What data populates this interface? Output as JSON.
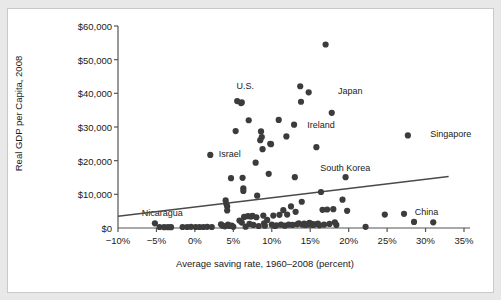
{
  "chart_data": {
    "type": "scatter",
    "title": "",
    "xlabel": "Average saving rate, 1960–2008 (percent)",
    "ylabel": "Real GDP per Capita, 2008",
    "xlim": [
      -10,
      35
    ],
    "ylim": [
      0,
      60000
    ],
    "xticks": [
      -10,
      -5,
      0,
      5,
      10,
      15,
      20,
      25,
      30,
      35
    ],
    "xtick_labels": [
      "−10%",
      "−5%",
      "0%",
      "5%",
      "10%",
      "15%",
      "20%",
      "25%",
      "30%",
      "35%"
    ],
    "yticks": [
      0,
      10000,
      20000,
      30000,
      40000,
      50000,
      60000
    ],
    "ytick_labels": [
      "$0",
      "$10,000",
      "$20,000",
      "$30,000",
      "$40,000",
      "$50,000",
      "$60,000"
    ],
    "grid": false,
    "legend": "none",
    "marker_color": "#3c3c3c",
    "line_color": "#4a4a4a",
    "axis_color": "#555555",
    "trendline": {
      "x": [
        -10.0,
        33.0
      ],
      "y": [
        3500,
        15300
      ]
    },
    "annotations": [
      {
        "text": "U.S.",
        "x": 5.4,
        "y": 41800
      },
      {
        "text": "Japan",
        "x": 18.6,
        "y": 40300
      },
      {
        "text": "Ireland",
        "x": 14.6,
        "y": 30300
      },
      {
        "text": "Singapore",
        "x": 30.6,
        "y": 27500
      },
      {
        "text": "Israel",
        "x": 3.1,
        "y": 21700
      },
      {
        "text": "South Korea",
        "x": 16.3,
        "y": 17500
      },
      {
        "text": "Nicaragua",
        "x": -6.9,
        "y": 4200
      },
      {
        "text": "China",
        "x": 28.6,
        "y": 4600
      }
    ],
    "points": [
      {
        "x": -5.2,
        "y": 1400
      },
      {
        "x": -4.6,
        "y": 300
      },
      {
        "x": -4.0,
        "y": 250
      },
      {
        "x": -3.5,
        "y": 250
      },
      {
        "x": -3.1,
        "y": 250
      },
      {
        "x": -1.6,
        "y": 300
      },
      {
        "x": -1.0,
        "y": 300
      },
      {
        "x": -0.5,
        "y": 350
      },
      {
        "x": 0.1,
        "y": 300
      },
      {
        "x": 0.6,
        "y": 300
      },
      {
        "x": 1.1,
        "y": 300
      },
      {
        "x": 1.6,
        "y": 350
      },
      {
        "x": 2.0,
        "y": 21700
      },
      {
        "x": 2.2,
        "y": 300
      },
      {
        "x": 3.4,
        "y": 1100
      },
      {
        "x": 3.6,
        "y": 700
      },
      {
        "x": 3.9,
        "y": 500
      },
      {
        "x": 4.0,
        "y": 8200
      },
      {
        "x": 4.1,
        "y": 7100
      },
      {
        "x": 4.2,
        "y": 6400
      },
      {
        "x": 4.2,
        "y": 5200
      },
      {
        "x": 4.3,
        "y": 1000
      },
      {
        "x": 4.5,
        "y": 600
      },
      {
        "x": 4.7,
        "y": 14800
      },
      {
        "x": 4.8,
        "y": 700
      },
      {
        "x": 5.0,
        "y": 350
      },
      {
        "x": 5.3,
        "y": 28800
      },
      {
        "x": 5.5,
        "y": 37700
      },
      {
        "x": 5.8,
        "y": 2200
      },
      {
        "x": 6.0,
        "y": 37100
      },
      {
        "x": 6.1,
        "y": 37300
      },
      {
        "x": 6.1,
        "y": 1600
      },
      {
        "x": 6.2,
        "y": 14900
      },
      {
        "x": 6.3,
        "y": 11800
      },
      {
        "x": 6.3,
        "y": 11000
      },
      {
        "x": 6.4,
        "y": 3300
      },
      {
        "x": 6.6,
        "y": 400
      },
      {
        "x": 6.9,
        "y": 3500
      },
      {
        "x": 7.0,
        "y": 32000
      },
      {
        "x": 7.1,
        "y": 1200
      },
      {
        "x": 7.3,
        "y": 3400
      },
      {
        "x": 7.5,
        "y": 3600
      },
      {
        "x": 7.6,
        "y": 900
      },
      {
        "x": 7.9,
        "y": 19400
      },
      {
        "x": 8.0,
        "y": 3200
      },
      {
        "x": 8.1,
        "y": 9600
      },
      {
        "x": 8.3,
        "y": 600
      },
      {
        "x": 8.5,
        "y": 26100
      },
      {
        "x": 8.6,
        "y": 28700
      },
      {
        "x": 8.7,
        "y": 27000
      },
      {
        "x": 8.8,
        "y": 23400
      },
      {
        "x": 8.9,
        "y": 3700
      },
      {
        "x": 9.0,
        "y": 1400
      },
      {
        "x": 9.1,
        "y": 700
      },
      {
        "x": 9.4,
        "y": 2400
      },
      {
        "x": 9.6,
        "y": 16100
      },
      {
        "x": 9.8,
        "y": 25000
      },
      {
        "x": 9.9,
        "y": 24900
      },
      {
        "x": 10.0,
        "y": 1000
      },
      {
        "x": 10.2,
        "y": 3700
      },
      {
        "x": 10.4,
        "y": 600
      },
      {
        "x": 10.6,
        "y": 800
      },
      {
        "x": 10.9,
        "y": 32100
      },
      {
        "x": 11.0,
        "y": 3900
      },
      {
        "x": 11.2,
        "y": 1000
      },
      {
        "x": 11.5,
        "y": 5300
      },
      {
        "x": 11.7,
        "y": 700
      },
      {
        "x": 11.9,
        "y": 27200
      },
      {
        "x": 12.0,
        "y": 4000
      },
      {
        "x": 12.2,
        "y": 1000
      },
      {
        "x": 12.5,
        "y": 6400
      },
      {
        "x": 12.7,
        "y": 900
      },
      {
        "x": 12.9,
        "y": 30700
      },
      {
        "x": 13.0,
        "y": 15100
      },
      {
        "x": 13.1,
        "y": 4800
      },
      {
        "x": 13.3,
        "y": 1100
      },
      {
        "x": 13.5,
        "y": 1400
      },
      {
        "x": 13.7,
        "y": 42100
      },
      {
        "x": 13.8,
        "y": 37500
      },
      {
        "x": 13.9,
        "y": 7800
      },
      {
        "x": 14.0,
        "y": 1000
      },
      {
        "x": 14.2,
        "y": 1300
      },
      {
        "x": 14.4,
        "y": 900
      },
      {
        "x": 14.6,
        "y": 1100
      },
      {
        "x": 14.8,
        "y": 40300
      },
      {
        "x": 14.9,
        "y": 1500
      },
      {
        "x": 15.0,
        "y": 1000
      },
      {
        "x": 15.2,
        "y": 1200
      },
      {
        "x": 15.4,
        "y": 900
      },
      {
        "x": 15.6,
        "y": 1100
      },
      {
        "x": 15.8,
        "y": 24000
      },
      {
        "x": 16.0,
        "y": 1300
      },
      {
        "x": 16.2,
        "y": 800
      },
      {
        "x": 16.4,
        "y": 10700
      },
      {
        "x": 16.6,
        "y": 5400
      },
      {
        "x": 16.8,
        "y": 1000
      },
      {
        "x": 17.0,
        "y": 54500
      },
      {
        "x": 17.2,
        "y": 5500
      },
      {
        "x": 17.5,
        "y": 1200
      },
      {
        "x": 17.8,
        "y": 34200
      },
      {
        "x": 18.0,
        "y": 5600
      },
      {
        "x": 18.2,
        "y": 1700
      },
      {
        "x": 18.4,
        "y": 900
      },
      {
        "x": 19.2,
        "y": 8400
      },
      {
        "x": 19.6,
        "y": 15100
      },
      {
        "x": 19.8,
        "y": 5100
      },
      {
        "x": 22.2,
        "y": 350
      },
      {
        "x": 24.7,
        "y": 4000
      },
      {
        "x": 27.2,
        "y": 4200
      },
      {
        "x": 27.7,
        "y": 27500
      },
      {
        "x": 28.5,
        "y": 1800
      },
      {
        "x": 31.0,
        "y": 1700
      }
    ]
  }
}
